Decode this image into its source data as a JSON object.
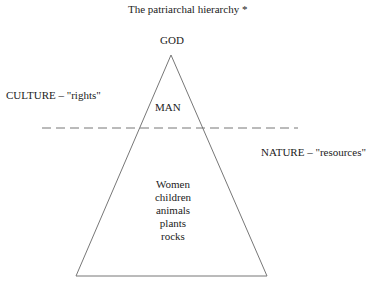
{
  "title": "The patriarchal hierarchy *",
  "apex_label": "GOD",
  "upper_label": "MAN",
  "culture_label": "CULTURE – \"rights\"",
  "nature_label": "NATURE – \"resources\"",
  "lower_items": [
    "Women",
    "children",
    "animals",
    "plants",
    "rocks"
  ]
}
